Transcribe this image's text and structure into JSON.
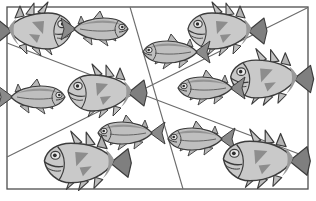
{
  "figure": {
    "background_color": "#ffffff",
    "frame": {
      "name": "outer-rectangle-border",
      "x": 7,
      "y": 7,
      "width": 301,
      "height": 182,
      "stroke_color": "#4d4d4d",
      "stroke_width": 1.3
    },
    "center_point": {
      "x": 153,
      "y": 90
    },
    "divider_lines": [
      {
        "name": "divider-line-steep",
        "x1": 130,
        "y1": 7,
        "x2": 183,
        "y2": 189,
        "stroke_color": "#6b6b6b",
        "stroke_width": 1.1
      },
      {
        "name": "divider-line-down-right",
        "x1": 7,
        "y1": 43,
        "x2": 307,
        "y2": 157,
        "stroke_color": "#6b6b6b",
        "stroke_width": 1.1
      },
      {
        "name": "divider-line-up-right",
        "x1": 7,
        "y1": 157,
        "x2": 307,
        "y2": 8,
        "stroke_color": "#6b6b6b",
        "stroke_width": 1.1
      }
    ],
    "fish_colors": {
      "body_light": "#cfcfcf",
      "body_mid": "#b2b2b2",
      "body_dark": "#8e8e8e",
      "fin_dark": "#7a7a7a",
      "outline": "#3c3c3c",
      "eye_white": "#e8e8e8",
      "eye_pupil": "#2e2e2e"
    },
    "counts": {
      "total_fish": 12,
      "fat_fish": 6,
      "slim_fish": 6,
      "sectors": 6
    },
    "fish": [
      {
        "id": "fish-1",
        "kind": "fat",
        "facing": "right",
        "x": 46,
        "y": 31,
        "scale": 1.0,
        "sector": 1
      },
      {
        "id": "fish-2",
        "kind": "slim",
        "facing": "right",
        "x": 104,
        "y": 29,
        "scale": 1.0,
        "sector": 1
      },
      {
        "id": "fish-3",
        "kind": "fat",
        "facing": "left",
        "x": 214,
        "y": 31,
        "scale": 1.0,
        "sector": 2
      },
      {
        "id": "fish-4",
        "kind": "slim",
        "facing": "left",
        "x": 167,
        "y": 52,
        "scale": 1.0,
        "sector": 2
      },
      {
        "id": "fish-5",
        "kind": "fat",
        "facing": "left",
        "x": 258,
        "y": 79,
        "scale": 1.05,
        "sector": 3
      },
      {
        "id": "fish-6",
        "kind": "slim",
        "facing": "left",
        "x": 202,
        "y": 88,
        "scale": 1.0,
        "sector": 3
      },
      {
        "id": "fish-7",
        "kind": "slim",
        "facing": "right",
        "x": 41,
        "y": 97,
        "scale": 1.0,
        "sector": 6
      },
      {
        "id": "fish-8",
        "kind": "fat",
        "facing": "left",
        "x": 94,
        "y": 93,
        "scale": 1.0,
        "sector": 6
      },
      {
        "id": "fish-9",
        "kind": "slim",
        "facing": "left",
        "x": 122,
        "y": 133,
        "scale": 1.0,
        "sector": 5
      },
      {
        "id": "fish-10",
        "kind": "fat",
        "facing": "left",
        "x": 73,
        "y": 163,
        "scale": 1.1,
        "sector": 5
      },
      {
        "id": "fish-11",
        "kind": "slim",
        "facing": "left",
        "x": 192,
        "y": 139,
        "scale": 1.0,
        "sector": 4
      },
      {
        "id": "fish-12",
        "kind": "fat",
        "facing": "left",
        "x": 252,
        "y": 161,
        "scale": 1.1,
        "sector": 4
      }
    ]
  }
}
